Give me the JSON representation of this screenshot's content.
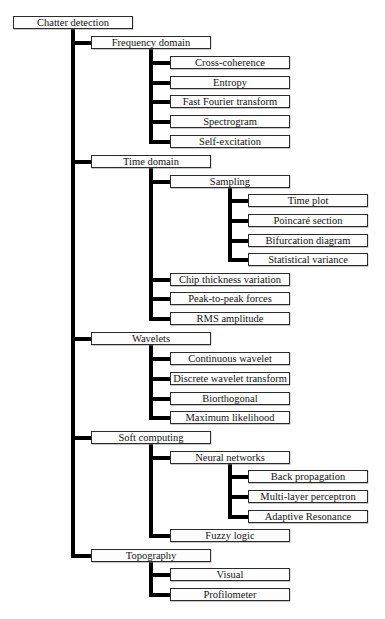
{
  "colors": {
    "connector": "#000000",
    "box_border": "#2b2b2b",
    "box_fill": "#fdfdfd",
    "background": "#ffffff",
    "text": "#141414"
  },
  "tree": {
    "label": "Chatter detection",
    "children": [
      {
        "label": "Frequency domain",
        "children": [
          {
            "label": "Cross-coherence"
          },
          {
            "label": "Entropy"
          },
          {
            "label": "Fast Fourier transform"
          },
          {
            "label": "Spectrogram"
          },
          {
            "label": "Self-excitation"
          }
        ]
      },
      {
        "label": "Time domain",
        "children": [
          {
            "label": "Sampling",
            "children": [
              {
                "label": "Time plot"
              },
              {
                "label": "Poincaré section"
              },
              {
                "label": "Bifurcation diagram"
              },
              {
                "label": "Statistical variance"
              }
            ]
          },
          {
            "label": "Chip thickness variation"
          },
          {
            "label": "Peak-to-peak forces"
          },
          {
            "label": "RMS amplitude"
          }
        ]
      },
      {
        "label": "Wavelets",
        "children": [
          {
            "label": "Continuous wavelet"
          },
          {
            "label": "Discrete wavelet transform"
          },
          {
            "label": "Biorthogonal"
          },
          {
            "label": "Maximum likelihood"
          }
        ]
      },
      {
        "label": "Soft computing",
        "children": [
          {
            "label": "Neural networks",
            "children": [
              {
                "label": "Back propagation"
              },
              {
                "label": "Multi-layer perceptron"
              },
              {
                "label": "Adaptive Resonance"
              }
            ]
          },
          {
            "label": "Fuzzy logic"
          }
        ]
      },
      {
        "label": "Topography",
        "children": [
          {
            "label": "Visual"
          },
          {
            "label": "Profilometer"
          }
        ]
      }
    ]
  }
}
